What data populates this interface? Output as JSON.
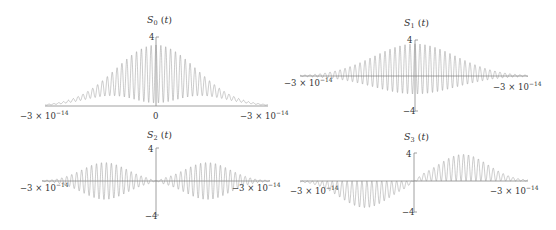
{
  "chart_data": [
    {
      "type": "line",
      "title": "S_0 (t)",
      "title_main": "S",
      "title_sub": "0",
      "title_arg": " (t)",
      "xlabel": "",
      "ylabel": "",
      "xlim": [
        -3e-14,
        3e-14
      ],
      "ylim": [
        0,
        4
      ],
      "x_tick_labels": [
        "−3 × 10^−14",
        "0",
        "−3 × 10^−14"
      ],
      "y_tick_labels": [
        "4"
      ],
      "tick_left": "−3 × 10",
      "tick_left_exp": "−14",
      "tick_center": "0",
      "tick_right": "−3 × 10",
      "tick_right_exp": "−14",
      "y_top": "4",
      "description": "Rapidly oscillating non-negative signal with Gaussian envelope peaking near 4 at t=0; lower envelope dips toward 0 at center",
      "envelope_peak": 3.7,
      "grid": false,
      "box": {
        "x0": 45,
        "x1": 268,
        "axis_y": 106,
        "yaxis_x": 156,
        "scale": 16.5
      },
      "mode": "s0"
    },
    {
      "type": "line",
      "title": "S_1 (t)",
      "title_main": "S",
      "title_sub": "1",
      "title_arg": " (t)",
      "xlim": [
        -3e-14,
        3e-14
      ],
      "ylim": [
        -4,
        4
      ],
      "x_tick_labels": [
        "−3 × 10^−14",
        "−3 × 10^−14"
      ],
      "y_tick_labels": [
        "4",
        "−4"
      ],
      "tick_left": "−3 × 10",
      "tick_left_exp": "−14",
      "tick_right": "−3 × 10",
      "tick_right_exp": "−14",
      "y_top": "4",
      "y_bottom": "−4",
      "description": "Oscillating signal with Gaussian envelope, mostly positive lobes up to ~3.5 with small negative swings",
      "envelope_peak": 3.5,
      "grid": false,
      "box": {
        "x0": 300,
        "x1": 528,
        "axis_y": 76,
        "yaxis_x": 415,
        "scale": 9.2
      },
      "mode": "s1"
    },
    {
      "type": "line",
      "title": "S_2 (t)",
      "title_main": "S",
      "title_sub": "2",
      "title_arg": " (t)",
      "xlim": [
        -3e-14,
        3e-14
      ],
      "ylim": [
        -4,
        4
      ],
      "x_tick_labels": [
        "−3 × 10^−14",
        "−3 × 10^−14"
      ],
      "y_tick_labels": [
        "4",
        "−4"
      ],
      "tick_left": "−3 × 10",
      "tick_left_exp": "−14",
      "tick_right": "−3 × 10",
      "tick_right_exp": "−14",
      "y_top": "4",
      "y_bottom": "−4",
      "description": "Symmetric oscillation with two-lobe envelope (peaks ~±2.2 at t≈±1.3e-14), node at t=0",
      "envelope_peak": 2.2,
      "grid": false,
      "box": {
        "x0": 42,
        "x1": 270,
        "axis_y": 181,
        "yaxis_x": 156,
        "scale": 8.4
      },
      "mode": "s2"
    },
    {
      "type": "line",
      "title": "S_3 (t)",
      "title_main": "S",
      "title_sub": "3",
      "title_arg": " (t)",
      "xlim": [
        -3e-14,
        3e-14
      ],
      "ylim": [
        -4,
        4
      ],
      "x_tick_labels": [
        "−3 × 10^−14",
        "−3 × 10^−14"
      ],
      "y_tick_labels": [
        "4",
        "−4"
      ],
      "tick_left": "−3 × 10",
      "tick_left_exp": "−14",
      "tick_right": "−3 × 10",
      "tick_right_exp": "−14",
      "y_top": "4",
      "y_bottom": "−4",
      "description": "Antisymmetric oscillation: negative lobe (~−3.6) for t<0, positive lobe (~+3.6) for t>0, rectified toward axis",
      "envelope_peak": 3.6,
      "grid": false,
      "box": {
        "x0": 300,
        "x1": 528,
        "axis_y": 181,
        "yaxis_x": 414,
        "scale": 7.4
      },
      "mode": "s3"
    }
  ]
}
